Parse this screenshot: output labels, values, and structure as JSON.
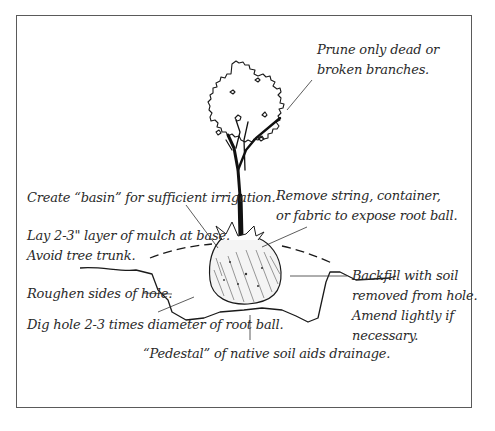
{
  "diagram": {
    "colors": {
      "ink": "#1a1a1a",
      "text": "#2a2a2a",
      "frame": "#5a5a5a",
      "background": "#ffffff"
    },
    "labels": {
      "prune": {
        "line1": "Prune only dead or",
        "line2": "broken branches."
      },
      "basin": {
        "line1": "Create “basin” for sufficient irrigation."
      },
      "remove": {
        "line1": "Remove string, container,",
        "line2": "or fabric to expose root ball."
      },
      "mulch": {
        "line1": "Lay 2-3\" layer of mulch at base.",
        "line2": "Avoid tree trunk."
      },
      "roughen": {
        "line1": "Roughen sides of hole."
      },
      "dig": {
        "line1": "Dig hole 2-3 times diameter of root ball."
      },
      "backfill": {
        "line1": "Backfill with soil",
        "line2": "removed from hole.",
        "line3": "Amend lightly if",
        "line4": "necessary."
      },
      "pedestal": {
        "line1": "“Pedestal” of native soil aids drainage."
      }
    },
    "elements": [
      "tree-crown",
      "tree-trunk",
      "root-ball",
      "planting-hole",
      "mulch-line",
      "leader-lines"
    ]
  }
}
